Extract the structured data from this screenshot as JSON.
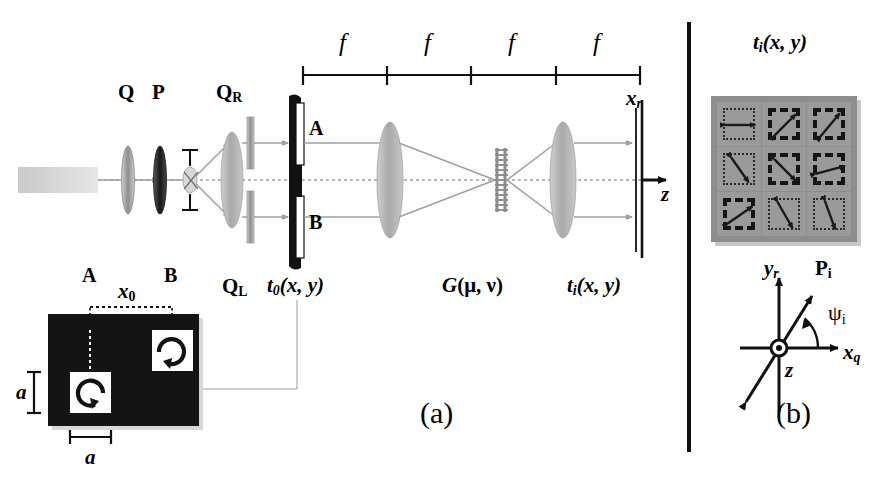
{
  "figure": {
    "panel_a_caption": "(a)",
    "panel_b_caption": "(b)",
    "divider": "vertical-rule"
  },
  "panel_a": {
    "optics_labels": {
      "quarter_wave_plate": "Q",
      "polarizer": "P",
      "quarter_wave_right": "Q",
      "quarter_wave_right_sub": "R",
      "quarter_wave_left": "Q",
      "quarter_wave_left_sub": "L",
      "aperture_a": "A",
      "aperture_b": "B",
      "object_transmittance": "t",
      "object_transmittance_sub": "0",
      "object_transmittance_args": "(x, y)",
      "grating": "G",
      "grating_args": "(μ, ν)",
      "image_transmittance": "t",
      "image_transmittance_sub": "i",
      "image_transmittance_args": "(x, y)",
      "screen_axis": "x",
      "screen_axis_sub": "r",
      "optic_axis": "z"
    },
    "focal_scale": {
      "tick_label": "f",
      "segments": 4,
      "segment_labels": [
        "f",
        "f",
        "f",
        "f"
      ]
    },
    "inset": {
      "label_a": "A",
      "label_b": "B",
      "separation_label": "x",
      "separation_sub": "0",
      "height_label": "a",
      "width_label": "a",
      "cell_a_rotation": "counterclockwise-circular-arrow",
      "cell_b_rotation": "clockwise-circular-arrow",
      "background": "#111111",
      "cell_fill": "#ffffff"
    }
  },
  "panel_b": {
    "title": "t",
    "title_sub": "i",
    "title_args": "(x, y)",
    "grid": {
      "rows": 3,
      "cols": 3,
      "background": "#8d8d8d",
      "cell_background": "#9a9a9a",
      "cells": [
        {
          "row": 0,
          "col": 0,
          "angle_deg": 0,
          "border": "dotted"
        },
        {
          "row": 0,
          "col": 1,
          "angle_deg": 45,
          "border": "dashed"
        },
        {
          "row": 0,
          "col": 2,
          "angle_deg": 50,
          "border": "dashed"
        },
        {
          "row": 1,
          "col": 0,
          "angle_deg": -55,
          "border": "dotted"
        },
        {
          "row": 1,
          "col": 1,
          "angle_deg": -45,
          "border": "dashed"
        },
        {
          "row": 1,
          "col": 2,
          "angle_deg": 15,
          "border": "dashed"
        },
        {
          "row": 2,
          "col": 0,
          "angle_deg": 35,
          "border": "dashed"
        },
        {
          "row": 2,
          "col": 1,
          "angle_deg": -60,
          "border": "dotted"
        },
        {
          "row": 2,
          "col": 2,
          "angle_deg": -70,
          "border": "dotted"
        }
      ]
    },
    "axes": {
      "y_axis": "y",
      "y_axis_sub": "r",
      "x_axis": "x",
      "x_axis_sub": "q",
      "z_axis": "z",
      "polarization_vector": "P",
      "polarization_vector_sub": "i",
      "angle_label": "ψ",
      "angle_sub": "i",
      "vector_angle_deg": 55
    }
  },
  "colors": {
    "ink": "#111111",
    "ray": "#9aa0a6",
    "lens": "#b9b9b9",
    "plate": "#9b9b9b",
    "grid_bg": "#8d8d8d"
  }
}
